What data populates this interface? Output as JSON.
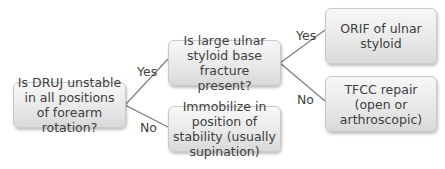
{
  "diagram": {
    "nodes": {
      "root": {
        "label": "Is DRUJ unstable in all positions of forearm rotation?"
      },
      "fracture_question": {
        "label": "Is large ulnar styloid base fracture present?"
      },
      "immobilize": {
        "label": "Immobilize in position of stability (usually supination)"
      },
      "orif": {
        "label": "ORIF of ulnar styloid"
      },
      "tfcc": {
        "label": "TFCC repair (open or arthroscopic)"
      }
    },
    "edges": [
      {
        "from": "root",
        "to": "fracture_question",
        "label": "Yes"
      },
      {
        "from": "root",
        "to": "immobilize",
        "label": "No"
      },
      {
        "from": "fracture_question",
        "to": "orif",
        "label": "Yes"
      },
      {
        "from": "fracture_question",
        "to": "tfcc",
        "label": "No"
      }
    ],
    "colors": {
      "line": "#7f7f7f",
      "text": "#404040",
      "box_top": "#f7f7f7",
      "box_bottom": "#d9d9d9"
    }
  }
}
